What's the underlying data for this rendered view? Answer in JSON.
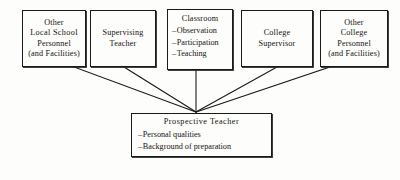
{
  "diagram": {
    "type": "convergence-flow-chart",
    "background_color": "#fdfdfb",
    "line_color": "#1a1a18",
    "text_color": "#131312",
    "convergence_point": {
      "x": 196,
      "y": 112
    },
    "sources": [
      {
        "id": "other-local-school-personnel",
        "title_lines": [
          "Other",
          "Local  School",
          "Personnel",
          "(and Facilities)"
        ],
        "bullets": [],
        "rect": {
          "x": 22,
          "y": 10,
          "w": 64,
          "h": 57
        },
        "connector_origin": {
          "x": 74,
          "y": 67
        }
      },
      {
        "id": "supervising-teacher",
        "title_lines": [
          "Supervising",
          "Teacher"
        ],
        "bullets": [],
        "rect": {
          "x": 90,
          "y": 10,
          "w": 66,
          "h": 57
        },
        "connector_origin": {
          "x": 124,
          "y": 67
        }
      },
      {
        "id": "classroom",
        "title_lines": [
          "Classroom"
        ],
        "bullets": [
          "Observation",
          "Participation",
          "Teaching"
        ],
        "rect": {
          "x": 167,
          "y": 9,
          "w": 66,
          "h": 61
        },
        "connector_origin": {
          "x": 196,
          "y": 70
        }
      },
      {
        "id": "college-supervisor",
        "title_lines": [
          "College",
          "Supervisor"
        ],
        "bullets": [],
        "rect": {
          "x": 241,
          "y": 10,
          "w": 72,
          "h": 57
        },
        "connector_origin": {
          "x": 277,
          "y": 67
        }
      },
      {
        "id": "other-college-personnel",
        "title_lines": [
          "Other",
          "College",
          "Personnel",
          "(and Facilities)"
        ],
        "bullets": [],
        "rect": {
          "x": 320,
          "y": 10,
          "w": 68,
          "h": 57
        },
        "connector_origin": {
          "x": 330,
          "y": 67
        }
      }
    ],
    "target": {
      "id": "prospective-teacher",
      "title": "Prospective  Teacher",
      "bullets": [
        "Personal  qualities",
        "Background of preparation"
      ],
      "rect": {
        "x": 131,
        "y": 113,
        "w": 141,
        "h": 44
      }
    },
    "bullet_marker": "–"
  }
}
